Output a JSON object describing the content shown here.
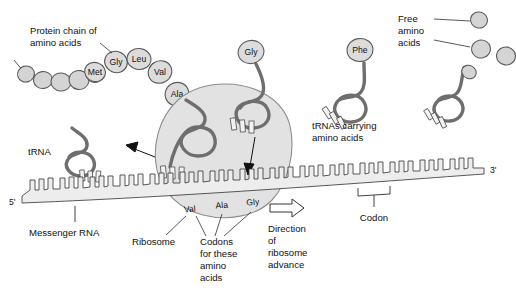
{
  "diagram": {
    "labels": {
      "protein_chain_line1": "Protein chain of",
      "protein_chain_line2": "amino acids",
      "trna_left": "tRNA",
      "trna_carrying_line1": "tRNAs carrying",
      "trna_carrying_line2": "amino acids",
      "free_aa_line1": "Free",
      "free_aa_line2": "amino",
      "free_aa_line3": "acids",
      "messenger_rna": "Messenger RNA",
      "ribosome": "Ribosome",
      "codons_line1": "Codons",
      "codons_line2": "for these",
      "codons_line3": "amino",
      "codons_line4": "acids",
      "direction_line1": "Direction",
      "direction_line2": "of",
      "direction_line3": "ribosome",
      "direction_line4": "advance",
      "codon": "Codon",
      "five_prime": "5'",
      "three_prime": "3'"
    },
    "protein_chain": {
      "unlabeled_residue_count": 5,
      "named_residues": [
        "Met",
        "Gly",
        "Leu",
        "Val",
        "Ala"
      ]
    },
    "ribosome_codon_labels": [
      "Val",
      "Ala",
      "Gly"
    ],
    "charged_trna_amino_acids": [
      "Gly",
      "Phe"
    ],
    "free_amino_acid_count": 4,
    "uncharged_trna_count": 1,
    "colors": {
      "amino_acid_fill": "#d4d4d4",
      "amino_acid_stroke": "#5a5a5a",
      "ribosome_fill": "#e2e2e2",
      "ribosome_stroke": "#8d8d8d",
      "trna_stroke": "#6e6e6e",
      "mrna_fill": "#ededed",
      "mrna_stroke": "#3c3c3c",
      "text": "#111111",
      "background": "#ffffff"
    }
  }
}
